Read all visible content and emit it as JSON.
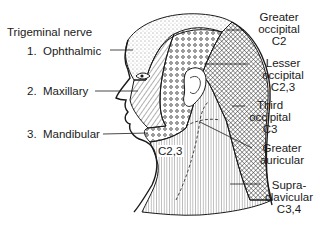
{
  "diagram": {
    "colors": {
      "ink": "#1a1a1a",
      "background": "#ffffff"
    },
    "left_labels": {
      "heading": "Trigeminal nerve",
      "items": [
        {
          "number": "1.",
          "name": "Ophthalmic"
        },
        {
          "number": "2.",
          "name": "Maxillary"
        },
        {
          "number": "3.",
          "name": "Mandibular"
        }
      ]
    },
    "right_labels": [
      {
        "line1": "Greater",
        "line2": "occipital",
        "line3": "C2"
      },
      {
        "line1": "Lesser",
        "line2": "occipital",
        "line3": "C2,3"
      },
      {
        "line1": "Third",
        "line2": "occipital",
        "line3": "C3"
      },
      {
        "line1": "Greater",
        "line2": "auricular"
      },
      {
        "line1": "Supra-",
        "line2": "clavicular",
        "line3": "C3,4"
      }
    ],
    "inline_labels": {
      "neck": "C2,3"
    }
  }
}
